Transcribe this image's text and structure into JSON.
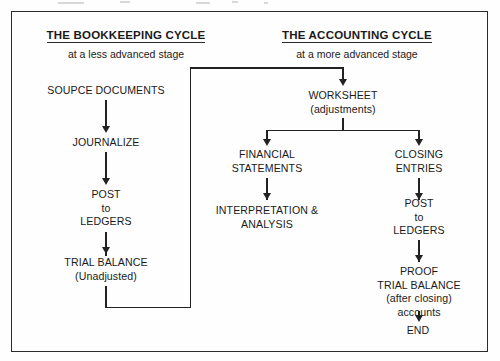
{
  "diagram": {
    "type": "flowchart",
    "border_color": "#2b2b2b",
    "line_color": "#222222",
    "background": "#fefefe"
  },
  "headers": {
    "left": {
      "title": "THE BOOKKEEPING CYCLE",
      "subtitle": "at a less advanced stage"
    },
    "right": {
      "title": "THE ACCOUNTING CYCLE",
      "subtitle": "at a more advanced stage"
    }
  },
  "nodes": {
    "source_documents": {
      "line1": "SOUPCE DOCUMENTS"
    },
    "journalize": {
      "line1": "JOURNALIZE"
    },
    "post_ledgers_left": {
      "line1": "POST",
      "line2": "to",
      "line3": "LEDGERS"
    },
    "trial_balance": {
      "line1": "TRIAL BALANCE",
      "line2": "(Unadjusted)"
    },
    "worksheet": {
      "line1": "WORKSHEET",
      "line2": "(adjustments)"
    },
    "financial_statements": {
      "line1": "FINANCIAL",
      "line2": "STATEMENTS"
    },
    "interpretation": {
      "line1": "INTERPRETATION &",
      "line2": "ANALYSIS"
    },
    "closing_entries": {
      "line1": "CLOSING",
      "line2": "ENTRIES"
    },
    "post_ledgers_right": {
      "line1": "POST",
      "line2": "to",
      "line3": "LEDGERS"
    },
    "proof_trial_balance": {
      "line1": "PROOF",
      "line2": "TRIAL BALANCE",
      "line3": "(after closing)",
      "line4": "accounts"
    },
    "end": {
      "line1": "END"
    }
  },
  "flow": {
    "left_sequence": [
      "SOUPCE DOCUMENTS",
      "JOURNALIZE",
      "POST to LEDGERS",
      "TRIAL BALANCE (Unadjusted)"
    ],
    "bridge": "TRIAL BALANCE (Unadjusted) -> WORKSHEET (adjustments)",
    "right_branches": [
      [
        "WORKSHEET (adjustments)",
        "FINANCIAL STATEMENTS",
        "INTERPRETATION & ANALYSIS"
      ],
      [
        "WORKSHEET (adjustments)",
        "CLOSING ENTRIES",
        "POST to LEDGERS",
        "PROOF TRIAL BALANCE (after closing) accounts",
        "END"
      ]
    ]
  }
}
